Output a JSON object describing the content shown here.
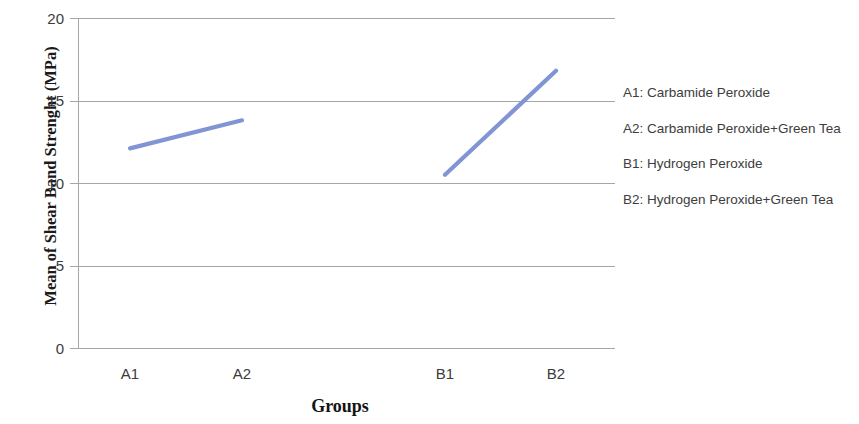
{
  "chart_data": {
    "type": "line",
    "title": "",
    "subtitle": "",
    "xlabel": "Groups",
    "ylabel": "Mean of Shear Band Strenght (MPa)",
    "categories": [
      "A1",
      "A2",
      "B1",
      "B2"
    ],
    "ylim": [
      0,
      20
    ],
    "yticks": [
      0,
      5,
      10,
      15,
      20
    ],
    "ytick_labels": [
      "0",
      "5",
      "10",
      "15",
      "20"
    ],
    "grid": "horizontal",
    "legend_position": "right-outside",
    "series": [
      {
        "name": "Carbamide Peroxide group",
        "color": "#8195d4",
        "x": [
          "A1",
          "A2"
        ],
        "values": [
          12.1,
          13.8
        ]
      },
      {
        "name": "Hydrogen Peroxide group",
        "color": "#8195d4",
        "x": [
          "B1",
          "B2"
        ],
        "values": [
          10.5,
          16.8
        ]
      }
    ],
    "annotations": [
      "A1: Carbamide  Peroxide",
      "A2: Carbamide Peroxide+Green Tea",
      "B1: Hydrogen Peroxide",
      "B2: Hydrogen Peroxide+Green Tea"
    ]
  },
  "axes": {
    "y_title": "Mean of Shear Band Strenght (MPa)",
    "x_title": "Groups",
    "y_ticks": [
      {
        "label": "20",
        "value": 20
      },
      {
        "label": "15",
        "value": 15
      },
      {
        "label": "10",
        "value": 10
      },
      {
        "label": "5",
        "value": 5
      },
      {
        "label": "0",
        "value": 0
      }
    ],
    "x_ticks": [
      {
        "label": "A1"
      },
      {
        "label": "A2"
      },
      {
        "label": "B1"
      },
      {
        "label": "B2"
      }
    ]
  },
  "legend": {
    "entries": [
      {
        "label": "A1: Carbamide  Peroxide"
      },
      {
        "label": "A2: Carbamide Peroxide+Green Tea"
      },
      {
        "label": "B1: Hydrogen Peroxide"
      },
      {
        "label": "B2: Hydrogen Peroxide+Green Tea"
      }
    ]
  },
  "colors": {
    "line": "#8195d4",
    "grid": "#a6a6a6",
    "axis": "#a6a6a6",
    "tick_text": "#3b3b3b",
    "title_text": "#131313",
    "background": "#ffffff"
  }
}
